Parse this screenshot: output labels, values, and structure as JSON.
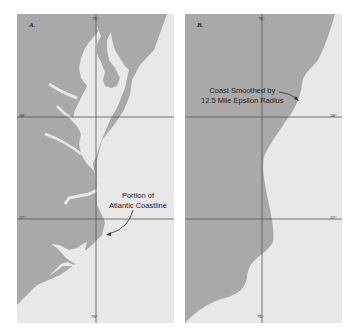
{
  "figure": {
    "panels": [
      {
        "id": "A",
        "label": "A.",
        "top_longitude": "76°",
        "bottom_longitude": "76°",
        "latitude_upper": "38°",
        "latitude_lower": "37°",
        "annotation": {
          "line1": "Portion of",
          "line2": "Atlantic Coastline"
        }
      },
      {
        "id": "B",
        "label": "B.",
        "top_longitude": "76°",
        "bottom_longitude": "76°",
        "latitude_upper": "38°",
        "latitude_lower": "37°",
        "annotation": {
          "line1": "Coast Smoothed by",
          "line2": "12.5 Mile Epsilon Radius"
        }
      }
    ],
    "colors": {
      "land": "#a9a9a9",
      "water": "#e8e8e8",
      "gridline": "#555555",
      "text": "#222222"
    }
  }
}
